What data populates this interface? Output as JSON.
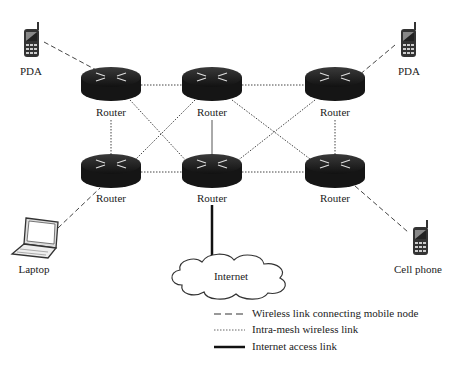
{
  "diagram": {
    "nodes": {
      "pda_left": {
        "label": "PDA"
      },
      "pda_right": {
        "label": "PDA"
      },
      "laptop": {
        "label": "Laptop"
      },
      "cell_phone": {
        "label": "Cell phone"
      },
      "internet": {
        "label": "Internet"
      },
      "routers": [
        {
          "id": "r1",
          "label": "Router"
        },
        {
          "id": "r2",
          "label": "Router"
        },
        {
          "id": "r3",
          "label": "Router"
        },
        {
          "id": "r4",
          "label": "Router"
        },
        {
          "id": "r5",
          "label": "Router"
        },
        {
          "id": "r6",
          "label": "Router"
        }
      ]
    },
    "legend": {
      "wireless_mobile": "Wireless link connecting mobile node",
      "intra_mesh": "Intra-mesh wireless link",
      "internet_access": "Internet access link"
    },
    "colors": {
      "router_body": "#1a1a1a",
      "line": "#333333"
    }
  }
}
